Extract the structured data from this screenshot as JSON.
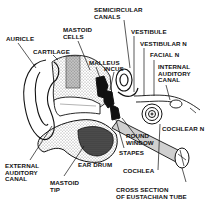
{
  "diagram": {
    "labels": {
      "semicircular_canals": "SEMICIRCULAR\nCANALS",
      "auricle": "AURICLE",
      "mastoid_cells": "MASTOID\nCELLS",
      "vestibule": "VESTIBULE",
      "vestibular_n": "VESTIBULAR N",
      "cartilage": "CARTILAGE",
      "malleus": "MALLEUS",
      "facial_n": "FACIAL N",
      "incus": "INCUS",
      "internal_auditory_canal": "INTERNAL\nAUDITORY\nCANAL",
      "cochlear_n": "COCHLEAR N",
      "round_window": "ROUND\nWINDOW",
      "stapes": "STAPES",
      "external_auditory_canal": "EXTERNAL\nAUDITORY\nCANAL",
      "ear_drum": "EAR DRUM",
      "cochlea": "COCHLEA",
      "mastoid_tip": "MASTOID\nTIP",
      "cross_section_eustachian": "CROSS SECTION\nOF EUSTACHIAN TUBE"
    },
    "colors": {
      "ink": "#111111",
      "background": "#ffffff"
    }
  }
}
